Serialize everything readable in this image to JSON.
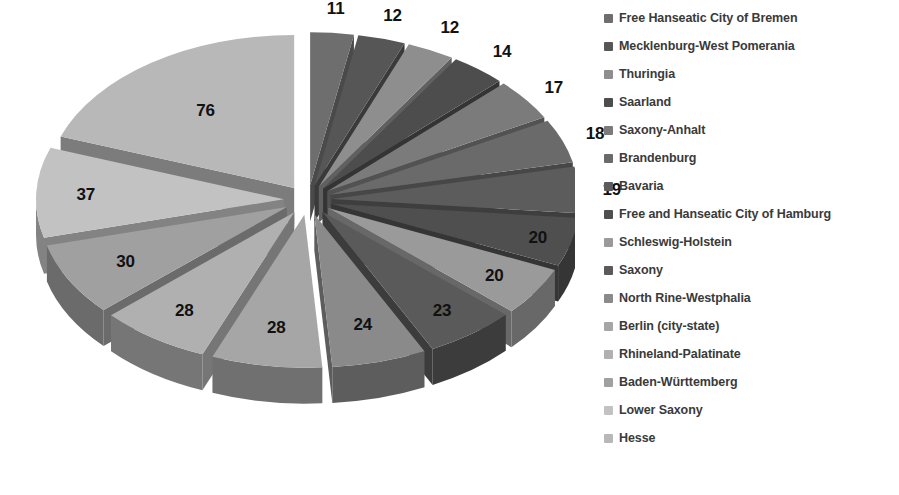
{
  "chart_data": {
    "type": "pie",
    "title": "",
    "subtitle": "",
    "xlabel": "",
    "ylabel": "",
    "total": 319,
    "exploded": true,
    "three_d": true,
    "legend_position": "right",
    "grid": false,
    "start_angle_deg": -90,
    "direction": "clockwise",
    "categories": [
      "Free Hanseatic City of Bremen",
      "Mecklenburg-West Pomerania",
      "Thuringia",
      "Saarland",
      "Saxony-Anhalt",
      "Brandenburg",
      "Bavaria",
      "Free and Hanseatic City of Hamburg",
      "Schleswig-Holstein",
      "Saxony",
      "North Rine-Westphalia",
      "Berlin (city-state)",
      "Rhineland-Palatinate",
      "Baden-Württemberg",
      "Lower Saxony",
      "Hesse"
    ],
    "values": [
      11,
      12,
      12,
      14,
      17,
      18,
      19,
      20,
      20,
      23,
      24,
      28,
      28,
      30,
      37,
      76
    ],
    "labels": [
      "11",
      "12",
      "12",
      "14",
      "17",
      "18",
      "19",
      "20",
      "20",
      "23",
      "24",
      "28",
      "28",
      "30",
      "37",
      "76"
    ],
    "colors": [
      "#6e6e6e",
      "#565656",
      "#8e8e8e",
      "#4d4d4d",
      "#7b7b7b",
      "#6a6a6a",
      "#5c5c5c",
      "#4f4f4f",
      "#9a9a9a",
      "#5a5a5a",
      "#8a8a8a",
      "#a6a6a6",
      "#b0b0b0",
      "#a0a0a0",
      "#c2c2c2",
      "#b8b8b8"
    ],
    "side_colors": [
      "#4a4a4a",
      "#3a3a3a",
      "#606060",
      "#343434",
      "#525252",
      "#474747",
      "#3e3e3e",
      "#353535",
      "#686868",
      "#3c3c3c",
      "#5d5d5d",
      "#707070",
      "#767676",
      "#6b6b6b",
      "#838383",
      "#7c7c7c"
    ]
  },
  "legend": {
    "items": [
      {
        "label": "Free Hanseatic City of Bremen",
        "color": "#6e6e6e"
      },
      {
        "label": "Mecklenburg-West Pomerania",
        "color": "#565656"
      },
      {
        "label": "Thuringia",
        "color": "#8e8e8e"
      },
      {
        "label": "Saarland",
        "color": "#4d4d4d"
      },
      {
        "label": "Saxony-Anhalt",
        "color": "#7b7b7b"
      },
      {
        "label": "Brandenburg",
        "color": "#6a6a6a"
      },
      {
        "label": "Bavaria",
        "color": "#5c5c5c"
      },
      {
        "label": "Free and Hanseatic City of Hamburg",
        "color": "#4f4f4f"
      },
      {
        "label": "Schleswig-Holstein",
        "color": "#9a9a9a"
      },
      {
        "label": "Saxony",
        "color": "#5a5a5a"
      },
      {
        "label": "North Rine-Westphalia",
        "color": "#8a8a8a"
      },
      {
        "label": "Berlin (city-state)",
        "color": "#a6a6a6"
      },
      {
        "label": "Rhineland-Palatinate",
        "color": "#b0b0b0"
      },
      {
        "label": "Baden-Württemberg",
        "color": "#a0a0a0"
      },
      {
        "label": "Lower Saxony",
        "color": "#c2c2c2"
      },
      {
        "label": "Hesse",
        "color": "#b8b8b8"
      }
    ]
  }
}
